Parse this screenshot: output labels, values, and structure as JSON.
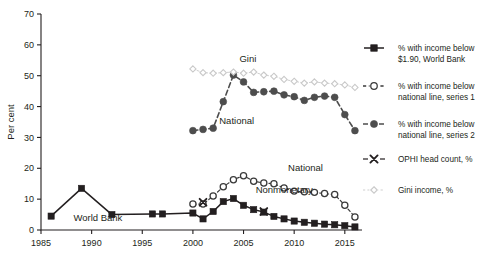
{
  "chart_data": {
    "type": "line",
    "title": "",
    "xlabel": "",
    "ylabel": "Per cent",
    "xlim": [
      1985,
      2016.5
    ],
    "ylim": [
      0,
      70
    ],
    "ytick_step": 10,
    "xtick_step": 5,
    "grid": false,
    "legend_position": "right",
    "yticks": [
      "0",
      "10",
      "20",
      "30",
      "40",
      "50",
      "60",
      "70"
    ],
    "xticks": [
      "1985",
      "1990",
      "1995",
      "2000",
      "2005",
      "2010",
      "2015"
    ],
    "annotations": [
      {
        "text": "World Bank",
        "x": 1988.2,
        "y": 2.8
      },
      {
        "text": "National",
        "x": 2002.6,
        "y": 34.5
      },
      {
        "text": "Gini",
        "x": 2004.6,
        "y": 54.5
      },
      {
        "text": "National",
        "x": 2009.4,
        "y": 19.0
      },
      {
        "text": "Nonmonetary",
        "x": 2006.2,
        "y": 12.0
      }
    ],
    "series": [
      {
        "name": "% with income below $1.90, World Bank",
        "legend_key": "wb",
        "marker": "square-filled",
        "color": "#231f20",
        "x": [
          1986,
          1989,
          1992,
          1996,
          1997,
          2000,
          2001,
          2002,
          2003,
          2004,
          2005,
          2006,
          2007,
          2008,
          2009,
          2010,
          2011,
          2012,
          2013,
          2014,
          2015,
          2016
        ],
        "y": [
          4.5,
          13.5,
          5.0,
          5.2,
          5.2,
          5.5,
          3.6,
          6.0,
          9.2,
          10.2,
          8.0,
          6.6,
          5.8,
          4.4,
          3.6,
          2.9,
          2.5,
          2.2,
          1.9,
          1.7,
          1.4,
          1.0
        ]
      },
      {
        "name": "% with income below national line, series 1",
        "legend_key": "nat1",
        "marker": "circle-open",
        "color": "#3a3a3a",
        "x": [
          2000,
          2001,
          2002,
          2003,
          2004,
          2005,
          2006,
          2007,
          2008,
          2009,
          2010,
          2011,
          2012,
          2013,
          2014,
          2015,
          2016
        ],
        "y": [
          8.4,
          8.4,
          11.0,
          14.0,
          16.3,
          17.6,
          15.8,
          15.2,
          15.0,
          13.6,
          12.6,
          12.4,
          12.2,
          11.8,
          11.5,
          8.0,
          4.2
        ]
      },
      {
        "name": "% with income below national line, series 2",
        "legend_key": "nat2",
        "marker": "circle-filled",
        "color": "#4d4d4d",
        "x": [
          2000,
          2001,
          2002,
          2003,
          2004,
          2005,
          2006,
          2007,
          2008,
          2009,
          2010,
          2011,
          2012,
          2013,
          2014,
          2015,
          2016
        ],
        "y": [
          32.2,
          32.6,
          33.0,
          41.6,
          50.2,
          48.0,
          44.6,
          44.8,
          45.0,
          43.8,
          43.2,
          42.0,
          43.0,
          43.4,
          43.0,
          37.4,
          32.2
        ]
      },
      {
        "name": "OPHI head count, %",
        "legend_key": "ophi",
        "marker": "x-cross",
        "color": "#231f20",
        "x": [
          2001,
          2007
        ],
        "y": [
          9.0,
          6.0
        ]
      },
      {
        "name": "Gini income, %",
        "legend_key": "gini",
        "marker": "diamond-open",
        "color": "#c9c9c9",
        "x": [
          2000,
          2001,
          2002,
          2003,
          2004,
          2005,
          2006,
          2007,
          2008,
          2009,
          2010,
          2011,
          2012,
          2013,
          2014,
          2015,
          2016
        ],
        "y": [
          52.2,
          51.0,
          50.8,
          51.0,
          51.2,
          50.8,
          51.2,
          50.2,
          49.8,
          48.8,
          48.2,
          47.6,
          48.0,
          47.6,
          47.4,
          47.0,
          46.2
        ]
      }
    ]
  },
  "legend": {
    "items": [
      {
        "key": "wb",
        "label_line1": "% with income below",
        "label_line2": "$1.90, World Bank"
      },
      {
        "key": "nat1",
        "label_line1": "% with income below",
        "label_line2": "national line, series 1"
      },
      {
        "key": "nat2",
        "label_line1": "% with income below",
        "label_line2": "national line, series 2"
      },
      {
        "key": "ophi",
        "label_line1": "OPHI head count, %",
        "label_line2": ""
      },
      {
        "key": "gini",
        "label_line1": "Gini income, %",
        "label_line2": ""
      }
    ]
  }
}
